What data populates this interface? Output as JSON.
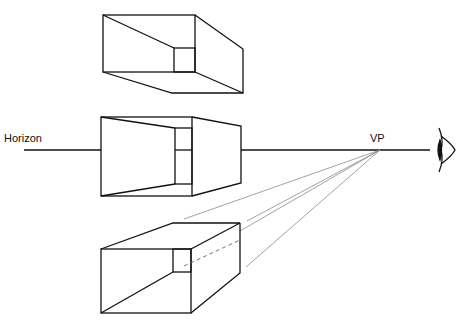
{
  "diagram": {
    "labels": {
      "horizon": "Horizon",
      "vanishing_point": "VP"
    },
    "colors": {
      "stroke": "#111111",
      "construction": "#8a8a8a",
      "background": "#ffffff"
    },
    "elements": [
      {
        "name": "box-above-horizon",
        "position": "above horizon"
      },
      {
        "name": "box-on-horizon",
        "position": "on horizon"
      },
      {
        "name": "box-below-horizon",
        "position": "below horizon"
      },
      {
        "name": "eye-icon",
        "position": "right of horizon"
      }
    ]
  }
}
